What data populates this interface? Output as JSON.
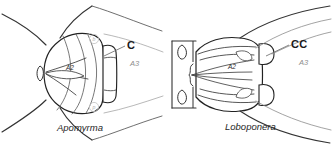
{
  "figure": {
    "panels": [
      {
        "id": "left",
        "taxon": "Apomyrma",
        "labels": {
          "structure": "C",
          "segment_a2": "A2",
          "segment_a3": "A3"
        },
        "marker_upper": "b",
        "marker_lower": "p"
      },
      {
        "id": "right",
        "taxon": "Loboponera",
        "labels": {
          "structure": "CC",
          "segment_a2": "A2",
          "segment_a3": "A3"
        }
      }
    ],
    "colors": {
      "ink": "#1a1a1a",
      "line": "#333333",
      "line_light": "#7a7a7a",
      "line_faint": "#b9b9b9",
      "background": "#ffffff"
    }
  }
}
